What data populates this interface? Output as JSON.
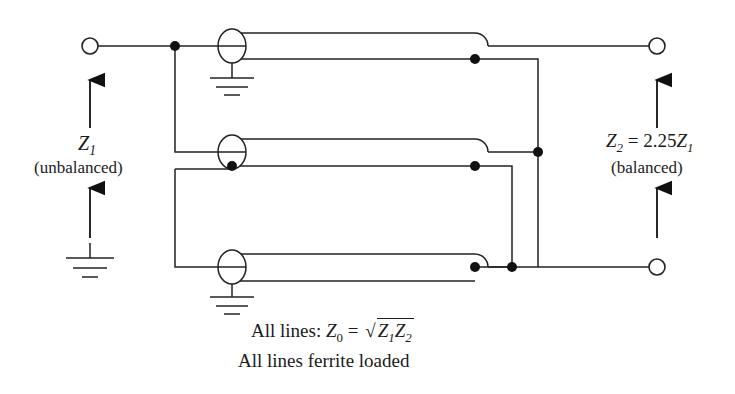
{
  "figure": {
    "stroke_color": "#222222",
    "background": "#ffffff"
  },
  "left_port": {
    "terminal_name": "input-terminal",
    "impedance_label": "Z",
    "impedance_sub": "1",
    "mode_label": "(unbalanced)",
    "arrow_up": "arrow-up",
    "arrow_down": "arrow-down",
    "ground": "ground-symbol"
  },
  "right_port": {
    "terminal_top_name": "output-terminal-top",
    "terminal_bottom_name": "output-terminal-bottom",
    "impedance_text_main": "Z",
    "impedance_text_sub": "2",
    "impedance_text_eq": " = 2.25",
    "impedance_text_z1": "Z",
    "impedance_text_z1sub": "1",
    "mode_label": "(balanced)",
    "arrow_up": "arrow-up",
    "arrow_down": "arrow-down"
  },
  "lines": [
    {
      "name": "transmission-line-1",
      "ground": true
    },
    {
      "name": "transmission-line-2",
      "ground": false
    },
    {
      "name": "transmission-line-3",
      "ground": true
    }
  ],
  "captions": {
    "line1_prefix": "All lines: ",
    "line1_z0": "Z",
    "line1_z0_sub": "0",
    "line1_eq": " = ",
    "line1_radicand_z1": "Z",
    "line1_radicand_z1sub": "1",
    "line1_radicand_z2": "Z",
    "line1_radicand_z2sub": "2",
    "line2": "All lines ferrite loaded"
  }
}
